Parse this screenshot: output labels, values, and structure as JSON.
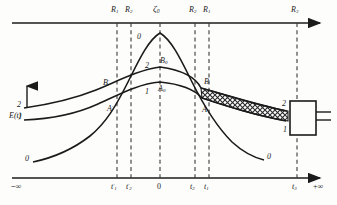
{
  "figure": {
    "kind": "hand-drawn scientific line diagram",
    "y_axis_label": "E(t)",
    "axis_end_left": "−∞",
    "axis_end_right": "+∞",
    "colors": {
      "ink": "#1b1b1b",
      "paper": "#fdfdfb",
      "dashed": "#3a3a3a",
      "hatch": "#2a2a2a"
    }
  },
  "top_axis": {
    "name": "upper-horizontal-axis",
    "ticks": [
      {
        "id": "R1-left",
        "label_main": "R",
        "label_sub": "1",
        "x": 117
      },
      {
        "id": "R2-left",
        "label_main": "R",
        "label_sub": "2",
        "x": 131
      },
      {
        "id": "C0",
        "label_main": "ζ",
        "label_sub": "0",
        "x": 160
      },
      {
        "id": "R2-right",
        "label_main": "R",
        "label_sub": "2",
        "x": 195
      },
      {
        "id": "R1-right",
        "label_main": "R",
        "label_sub": "1",
        "x": 209
      },
      {
        "id": "R3",
        "label_main": "R",
        "label_sub": "3",
        "x": 297
      }
    ]
  },
  "bottom_axis": {
    "name": "lower-horizontal-axis",
    "ticks": [
      {
        "id": "t1-prime",
        "label_main": "t",
        "label_sub": "1",
        "prime": true,
        "x": 117
      },
      {
        "id": "t2-prime",
        "label_main": "t",
        "label_sub": "2",
        "prime": true,
        "x": 131
      },
      {
        "id": "origin",
        "label_main": "0",
        "label_sub": "",
        "prime": false,
        "x": 160
      },
      {
        "id": "t2",
        "label_main": "t",
        "label_sub": "2",
        "prime": false,
        "x": 195
      },
      {
        "id": "t1",
        "label_main": "t",
        "label_sub": "1",
        "prime": false,
        "x": 209
      },
      {
        "id": "t3",
        "label_main": "t",
        "label_sub": "3",
        "prime": false,
        "x": 297
      }
    ]
  },
  "curves": [
    {
      "id": "curve-0",
      "label": "0",
      "description": "tall sharply peaked curve, low at both infinities"
    },
    {
      "id": "curve-2",
      "label": "2",
      "description": "upper broad curve, starts higher on the left"
    },
    {
      "id": "curve-1",
      "label": "1",
      "description": "lower broad curve, starts lower on the left"
    }
  ],
  "curve_end_labels": {
    "left": [
      {
        "id": "curve-2-left",
        "text": "2",
        "x": 17,
        "y": 107
      },
      {
        "id": "curve-1-left",
        "text": "1",
        "x": 17,
        "y": 119
      },
      {
        "id": "curve-0-left",
        "text": "0",
        "x": 29,
        "y": 160
      }
    ],
    "right": [
      {
        "id": "curve-2-right",
        "text": "2",
        "x": 285,
        "y": 107
      },
      {
        "id": "curve-1-right",
        "text": "1",
        "x": 285,
        "y": 131
      },
      {
        "id": "curve-0-right",
        "text": "0",
        "x": 268,
        "y": 159
      }
    ],
    "inner": [
      {
        "id": "curve-0-inner-top",
        "text": "0",
        "x": 139,
        "y": 38
      },
      {
        "id": "curve-2-inner",
        "text": "2",
        "x": 146,
        "y": 68
      },
      {
        "id": "curve-1-inner",
        "text": "1",
        "x": 146,
        "y": 94
      }
    ]
  },
  "points": [
    {
      "id": "B-prime",
      "label_main": "B",
      "label_sub": "",
      "prime": true,
      "x": 106,
      "y": 84
    },
    {
      "id": "A-prime",
      "label_main": "A",
      "label_sub": "",
      "prime": true,
      "x": 110,
      "y": 110
    },
    {
      "id": "B0",
      "label_main": "B",
      "label_sub": "0",
      "prime": false,
      "x": 163,
      "y": 62
    },
    {
      "id": "A0",
      "label_main": "A",
      "label_sub": "0",
      "prime": false,
      "x": 161,
      "y": 90
    },
    {
      "id": "B",
      "label_main": "B",
      "label_sub": "",
      "prime": false,
      "x": 205,
      "y": 83
    },
    {
      "id": "A",
      "label_main": "A",
      "label_sub": "",
      "prime": false,
      "x": 203,
      "y": 111
    }
  ],
  "band": {
    "id": "hatched-band",
    "description": "cross-hatched tapering band from point B toward the detector box"
  },
  "box": {
    "id": "detector-box",
    "description": "rectangle at the right edge with two leads exiting to the right"
  }
}
